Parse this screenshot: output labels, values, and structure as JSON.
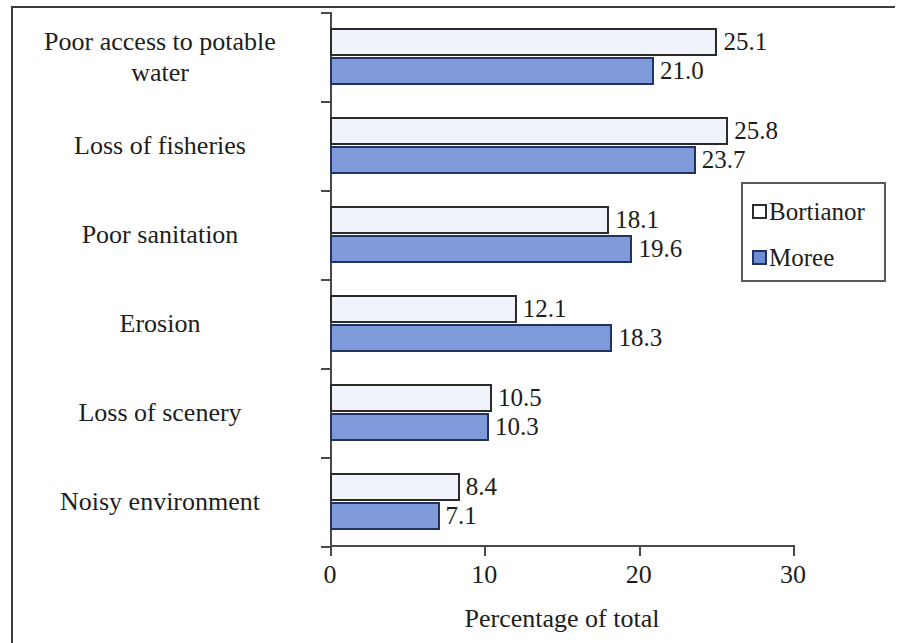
{
  "chart_data": {
    "type": "bar",
    "orientation": "horizontal",
    "title": "",
    "xlabel": "Percentage of total",
    "ylabel": "",
    "xlim": [
      0,
      30
    ],
    "xticks": [
      "0",
      "10",
      "20",
      "30"
    ],
    "grid": false,
    "legend_position": "right-middle",
    "categories": [
      "Poor access to potable water",
      "Loss of fisheries",
      "Poor sanitation",
      "Erosion",
      "Loss of scenery",
      "Noisy environment"
    ],
    "series": [
      {
        "name": "Bortianor",
        "color": "#f0f4fa",
        "values": [
          25.1,
          25.8,
          18.1,
          12.1,
          10.5,
          8.4
        ],
        "labels": [
          "25.1",
          "25.8",
          "18.1",
          "12.1",
          "10.5",
          "8.4"
        ]
      },
      {
        "name": "Moree",
        "color": "#7e9ada",
        "values": [
          21.0,
          23.7,
          19.6,
          18.3,
          10.3,
          7.1
        ],
        "labels": [
          "21.0",
          "23.7",
          "19.6",
          "18.3",
          "10.3",
          "7.1"
        ]
      }
    ]
  },
  "axis": {
    "x_title": "Percentage of total",
    "x_tick_labels": [
      "0",
      "10",
      "20",
      "30"
    ]
  },
  "category_labels": [
    {
      "line1": "Poor access to potable",
      "line2": "water"
    },
    {
      "line1": "Loss of fisheries",
      "line2": ""
    },
    {
      "line1": "Poor sanitation",
      "line2": ""
    },
    {
      "line1": "Erosion",
      "line2": ""
    },
    {
      "line1": "Loss of scenery",
      "line2": ""
    },
    {
      "line1": "Noisy environment",
      "line2": ""
    }
  ],
  "legend": {
    "entries": [
      {
        "label": "Bortianor",
        "swatch": "series-a"
      },
      {
        "label": "Moree",
        "swatch": "series-b"
      }
    ]
  }
}
